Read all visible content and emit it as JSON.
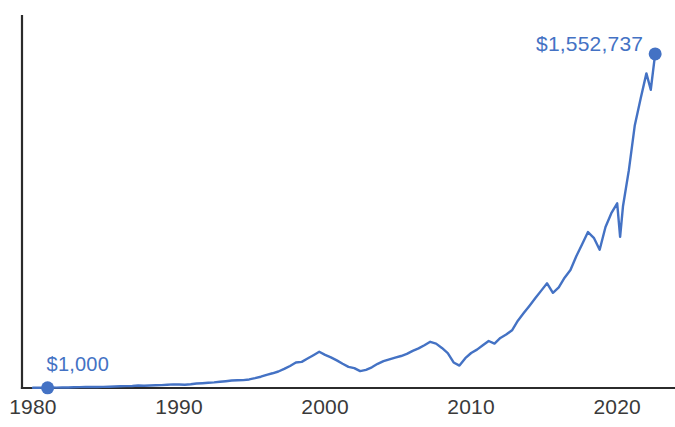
{
  "chart_data": {
    "type": "line",
    "title": "",
    "subtitle": "",
    "xlabel": "",
    "ylabel": "",
    "grid": false,
    "legend": "none",
    "xlim": [
      1980,
      2023
    ],
    "ylim": [
      0,
      1650000
    ],
    "yscale": "linear",
    "x_tick_labels": [
      "1980",
      "1990",
      "2000",
      "2010",
      "2020"
    ],
    "x_ticks": [
      1980,
      1990,
      2000,
      2010,
      2020
    ],
    "annotations": [
      {
        "name": "start-value-label",
        "text": "$1,000",
        "x": 1981,
        "y": 1000
      },
      {
        "name": "end-value-label",
        "text": "$1,552,737",
        "x": 2022.6,
        "y": 1552737
      }
    ],
    "markers": [
      {
        "name": "start-marker",
        "x": 1981,
        "y": 1000,
        "color": "#4472C4"
      },
      {
        "name": "end-marker",
        "x": 2022.6,
        "y": 1552737,
        "color": "#4472C4"
      }
    ],
    "series": [
      {
        "name": "Growth of $1,000",
        "color": "#4472C4",
        "x": [
          1980.0,
          1980.4,
          1980.8,
          1981.2,
          1981.6,
          1982.0,
          1982.4,
          1982.8,
          1983.2,
          1983.6,
          1984.0,
          1984.4,
          1984.8,
          1985.2,
          1985.6,
          1986.0,
          1986.4,
          1986.8,
          1987.2,
          1987.6,
          1988.0,
          1988.4,
          1988.8,
          1989.2,
          1989.6,
          1990.0,
          1990.4,
          1990.8,
          1991.2,
          1991.6,
          1992.0,
          1992.4,
          1992.8,
          1993.2,
          1993.6,
          1994.0,
          1994.4,
          1994.8,
          1995.2,
          1995.6,
          1996.0,
          1996.4,
          1996.8,
          1997.2,
          1997.6,
          1998.0,
          1998.4,
          1998.8,
          1999.2,
          1999.6,
          2000.0,
          2000.4,
          2000.8,
          2001.2,
          2001.6,
          2002.0,
          2002.4,
          2002.8,
          2003.2,
          2003.6,
          2004.0,
          2004.4,
          2004.8,
          2005.2,
          2005.6,
          2006.0,
          2006.4,
          2006.8,
          2007.2,
          2007.6,
          2008.0,
          2008.4,
          2008.8,
          2009.2,
          2009.6,
          2010.0,
          2010.4,
          2010.8,
          2011.2,
          2011.6,
          2012.0,
          2012.4,
          2012.8,
          2013.2,
          2013.6,
          2014.0,
          2014.4,
          2014.8,
          2015.2,
          2015.6,
          2016.0,
          2016.4,
          2016.8,
          2017.2,
          2017.6,
          2018.0,
          2018.4,
          2018.8,
          2019.2,
          2019.6,
          2020.0,
          2020.2,
          2020.4,
          2020.8,
          2021.2,
          2021.6,
          2022.0,
          2022.3,
          2022.6
        ],
        "y": [
          1000,
          1300,
          1800,
          2100,
          1900,
          2200,
          2600,
          3400,
          4200,
          4600,
          4800,
          4700,
          5200,
          6000,
          6800,
          7800,
          8900,
          9600,
          11500,
          10200,
          11800,
          12600,
          13400,
          15200,
          16800,
          16200,
          15400,
          17600,
          20800,
          22400,
          24600,
          26200,
          28800,
          31400,
          34600,
          35800,
          36400,
          39800,
          45600,
          52400,
          61200,
          68400,
          76800,
          88600,
          102400,
          118600,
          121400,
          136800,
          152600,
          168400,
          154200,
          142600,
          128400,
          112600,
          98400,
          92600,
          78400,
          84600,
          96200,
          112400,
          124600,
          132800,
          141200,
          148600,
          158400,
          172600,
          184200,
          198600,
          214800,
          206400,
          186200,
          162400,
          118600,
          104200,
          138400,
          162600,
          178400,
          198600,
          218400,
          206200,
          232600,
          248400,
          268200,
          312600,
          348400,
          382600,
          418200,
          452600,
          486400,
          442600,
          468200,
          512600,
          548400,
          612600,
          668400,
          724600,
          698200,
          642600,
          748400,
          812600,
          858400,
          702600,
          846200,
          1012400,
          1218600,
          1342800,
          1462400,
          1386200,
          1552737
        ]
      }
    ]
  },
  "axes": {
    "x_axis_name": "year-axis",
    "y_axis_name": "value-axis"
  }
}
